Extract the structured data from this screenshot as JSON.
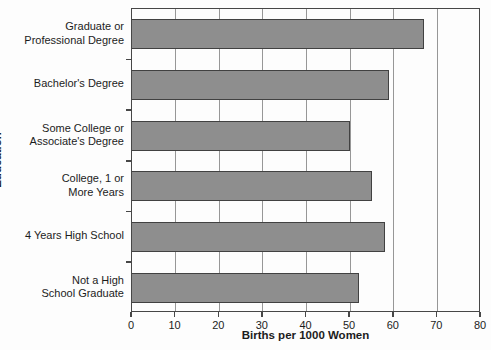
{
  "chart_data": {
    "type": "bar",
    "orientation": "horizontal",
    "title": "",
    "xlabel": "Births per 1000 Women",
    "ylabel": "Education",
    "categories": [
      "Graduate or\nProfessional Degree",
      "Bachelor's Degree",
      "Some College or\nAssociate's Degree",
      "College, 1 or\nMore Years",
      "4 Years High School",
      "Not a High\nSchool Graduate"
    ],
    "values": [
      67,
      59,
      50,
      55,
      58,
      52
    ],
    "xlim": [
      0,
      80
    ],
    "xticks": [
      0,
      10,
      20,
      30,
      40,
      50,
      60,
      70,
      80
    ],
    "grid": true,
    "legend": "none",
    "colors": {
      "bar_fill": "#8e8e8e",
      "bar_border": "#414141",
      "gridline": "#979797",
      "frame": "#474747",
      "text": "#1c1c1c",
      "background": "#fdfdfd"
    }
  }
}
